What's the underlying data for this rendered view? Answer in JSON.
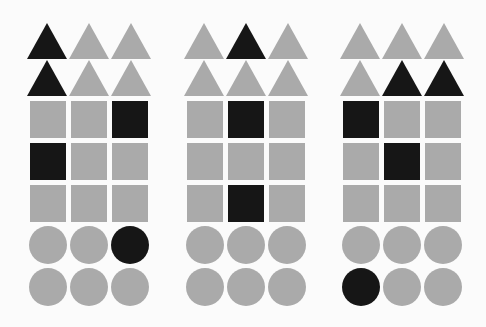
{
  "colors": {
    "gray": "#aaaaaa",
    "black": "#161616",
    "background": "#fbfbfb"
  },
  "panels": [
    {
      "name": "panel-1",
      "origin_x": 27,
      "triangles": [
        [
          "black",
          "gray",
          "gray"
        ],
        [
          "black",
          "gray",
          "gray"
        ]
      ],
      "squares": [
        [
          "gray",
          "gray",
          "black"
        ],
        [
          "black",
          "gray",
          "gray"
        ],
        [
          "gray",
          "gray",
          "gray"
        ]
      ],
      "circles": [
        [
          "gray",
          "gray",
          "black"
        ],
        [
          "gray",
          "gray",
          "gray"
        ]
      ]
    },
    {
      "name": "panel-2",
      "origin_x": 184,
      "triangles": [
        [
          "gray",
          "black",
          "gray"
        ],
        [
          "gray",
          "gray",
          "gray"
        ]
      ],
      "squares": [
        [
          "gray",
          "black",
          "gray"
        ],
        [
          "gray",
          "gray",
          "gray"
        ],
        [
          "gray",
          "black",
          "gray"
        ]
      ],
      "circles": [
        [
          "gray",
          "gray",
          "gray"
        ],
        [
          "gray",
          "gray",
          "gray"
        ]
      ]
    },
    {
      "name": "panel-3",
      "origin_x": 340,
      "triangles": [
        [
          "gray",
          "gray",
          "gray"
        ],
        [
          "gray",
          "black",
          "black"
        ]
      ],
      "squares": [
        [
          "black",
          "gray",
          "gray"
        ],
        [
          "gray",
          "black",
          "gray"
        ],
        [
          "gray",
          "gray",
          "gray"
        ]
      ],
      "circles": [
        [
          "gray",
          "gray",
          "gray"
        ],
        [
          "black",
          "gray",
          "gray"
        ]
      ]
    }
  ]
}
